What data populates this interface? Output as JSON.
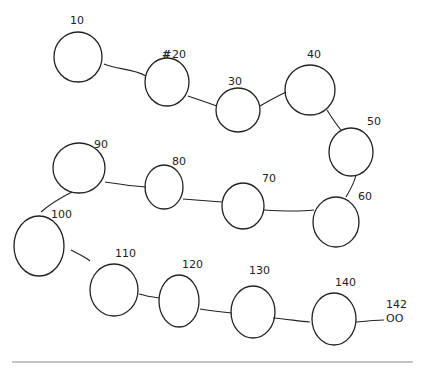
{
  "diagram": {
    "type": "hand-drawn linked node chain",
    "nodes": [
      {
        "id": "n10",
        "label": "10",
        "cx": 78,
        "cy": 57,
        "rx": 24,
        "ry": 25,
        "lx": 70,
        "ly": 24
      },
      {
        "id": "n20",
        "label": "20",
        "cx": 167,
        "cy": 82,
        "rx": 22,
        "ry": 24,
        "lx": 172,
        "ly": 58,
        "strike": "#"
      },
      {
        "id": "n30",
        "label": "30",
        "cx": 238,
        "cy": 110,
        "rx": 22,
        "ry": 22,
        "lx": 228,
        "ly": 85
      },
      {
        "id": "n40",
        "label": "40",
        "cx": 310,
        "cy": 90,
        "rx": 25,
        "ry": 25,
        "lx": 307,
        "ly": 58
      },
      {
        "id": "n50",
        "label": "50",
        "cx": 351,
        "cy": 152,
        "rx": 22,
        "ry": 24,
        "lx": 367,
        "ly": 125
      },
      {
        "id": "n60",
        "label": "60",
        "cx": 336,
        "cy": 222,
        "rx": 23,
        "ry": 25,
        "lx": 358,
        "ly": 200
      },
      {
        "id": "n70",
        "label": "70",
        "cx": 243,
        "cy": 206,
        "rx": 21,
        "ry": 23,
        "lx": 262,
        "ly": 182
      },
      {
        "id": "n80",
        "label": "80",
        "cx": 164,
        "cy": 187,
        "rx": 19,
        "ry": 22,
        "lx": 172,
        "ly": 165
      },
      {
        "id": "n90",
        "label": "90",
        "cx": 79,
        "cy": 168,
        "rx": 26,
        "ry": 25,
        "lx": 94,
        "ly": 148
      },
      {
        "id": "n100",
        "label": "100",
        "cx": 39,
        "cy": 246,
        "rx": 25,
        "ry": 30,
        "lx": 51,
        "ly": 218
      },
      {
        "id": "n110",
        "label": "110",
        "cx": 114,
        "cy": 290,
        "rx": 24,
        "ry": 26,
        "lx": 115,
        "ly": 257
      },
      {
        "id": "n120",
        "label": "120",
        "cx": 179,
        "cy": 301,
        "rx": 20,
        "ry": 26,
        "lx": 182,
        "ly": 268
      },
      {
        "id": "n130",
        "label": "130",
        "cx": 253,
        "cy": 312,
        "rx": 22,
        "ry": 26,
        "lx": 249,
        "ly": 274
      },
      {
        "id": "n140",
        "label": "140",
        "cx": 334,
        "cy": 319,
        "rx": 22,
        "ry": 26,
        "lx": 335,
        "ly": 286
      }
    ],
    "edges": [
      {
        "from": "n10",
        "to": "n20",
        "d": "M 104 64 C 118 70, 132 68, 146 76"
      },
      {
        "from": "n20",
        "to": "n30",
        "d": "M 188 96 C 200 100, 208 103, 217 106"
      },
      {
        "from": "n30",
        "to": "n40",
        "d": "M 260 106 C 270 100, 278 96, 286 92"
      },
      {
        "from": "n40",
        "to": "n50",
        "d": "M 327 110 C 332 118, 336 124, 341 130"
      },
      {
        "from": "n50",
        "to": "n60",
        "d": "M 356 175 C 354 184, 350 190, 346 197"
      },
      {
        "from": "n60",
        "to": "n70",
        "d": "M 314 210 C 296 212, 280 211, 264 210"
      },
      {
        "from": "n70",
        "to": "n80",
        "d": "M 222 202 C 208 201, 196 200, 183 199"
      },
      {
        "from": "n80",
        "to": "n90",
        "d": "M 146 187 C 130 186, 118 184, 105 182"
      },
      {
        "from": "n90",
        "to": "n100",
        "d": "M 72 192 C 60 198, 50 204, 41 212"
      },
      {
        "from": "n100",
        "to": "n110",
        "d": "M 71 250 C 78 254, 84 256, 90 261"
      },
      {
        "from": "n110",
        "to": "n120",
        "d": "M 139 294 C 146 296, 152 297, 159 298"
      },
      {
        "from": "n120",
        "to": "n130",
        "d": "M 200 309 C 212 311, 222 312, 232 313"
      },
      {
        "from": "n130",
        "to": "n140",
        "d": "M 273 318 C 286 319, 298 321, 310 322"
      },
      {
        "from": "n140",
        "to": "tail",
        "d": "M 356 322 C 366 321, 376 320, 384 320"
      }
    ],
    "tail": {
      "label": "142",
      "marker": "OO",
      "lx": 386,
      "ly": 308,
      "mx": 386,
      "my": 322
    },
    "bottom_rule": {
      "x1": 12,
      "x2": 413,
      "y": 362
    }
  }
}
